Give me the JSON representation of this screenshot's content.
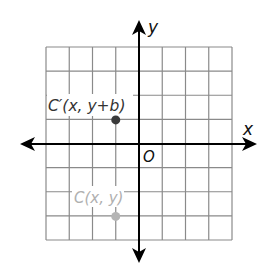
{
  "diagram": {
    "type": "coordinate-plane",
    "grid": {
      "columns": 8,
      "rows": 8,
      "left": 46,
      "top": 47,
      "right": 232,
      "bottom": 240,
      "line_color": "#8a8a8a"
    },
    "axes": {
      "color": "#000000",
      "origin_px": [
        139,
        144
      ],
      "x_axis_left_tip": 20,
      "x_axis_right_tip": 257,
      "y_axis_top_tip": 20,
      "y_axis_bottom_tip": 263,
      "x_label": "x",
      "y_label": "y",
      "origin_label": "O"
    },
    "points": [
      {
        "id": "C-prime",
        "label": "C′(x, y+b)",
        "grid_x": -1,
        "grid_y": 1,
        "color": "#3a3a3a",
        "label_color": "#333333"
      },
      {
        "id": "C",
        "label": "C(x, y)",
        "grid_x": -1,
        "grid_y": -3,
        "color": "#b5b5b5",
        "label_color": "#b0b0b0"
      }
    ]
  }
}
